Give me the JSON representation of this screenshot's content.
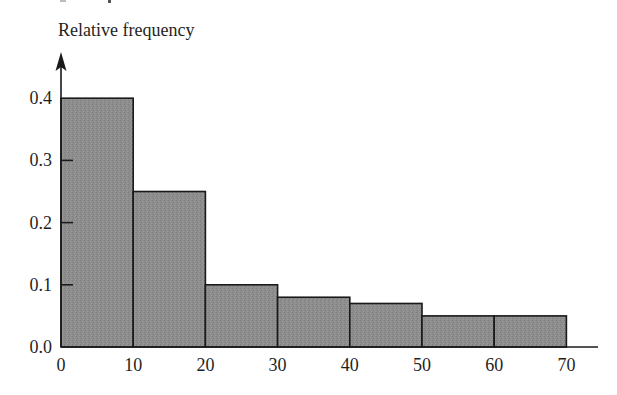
{
  "chart_data": {
    "type": "bar",
    "subtype": "histogram",
    "title": "",
    "xlabel": "",
    "ylabel": "Relative frequency",
    "bins": [
      {
        "start": 0,
        "end": 10,
        "value": 0.4
      },
      {
        "start": 10,
        "end": 20,
        "value": 0.25
      },
      {
        "start": 20,
        "end": 30,
        "value": 0.1
      },
      {
        "start": 30,
        "end": 40,
        "value": 0.08
      },
      {
        "start": 40,
        "end": 50,
        "value": 0.07
      },
      {
        "start": 50,
        "end": 60,
        "value": 0.05
      },
      {
        "start": 60,
        "end": 70,
        "value": 0.05
      }
    ],
    "categories": [
      "0-10",
      "10-20",
      "20-30",
      "30-40",
      "40-50",
      "50-60",
      "60-70"
    ],
    "values": [
      0.4,
      0.25,
      0.1,
      0.08,
      0.07,
      0.05,
      0.05
    ],
    "x_ticks": [
      "0",
      "10",
      "20",
      "30",
      "40",
      "50",
      "60",
      "70"
    ],
    "y_ticks": [
      "0.0",
      "0.1",
      "0.2",
      "0.3",
      "0.4"
    ],
    "xlim": [
      0,
      75
    ],
    "ylim": [
      0,
      0.45
    ],
    "grid": false,
    "legend": null,
    "colors": {
      "bar_fill": "#8c8c8c",
      "bar_stroke": "#1a1a1a",
      "axis": "#1a1a1a",
      "background": "#ffffff"
    }
  },
  "layout": {
    "origin_x": 61,
    "origin_y": 347,
    "px_per_x_unit": 7.22,
    "px_per_y_unit": 622,
    "x_axis_end": 598,
    "y_axis_top": 52
  }
}
